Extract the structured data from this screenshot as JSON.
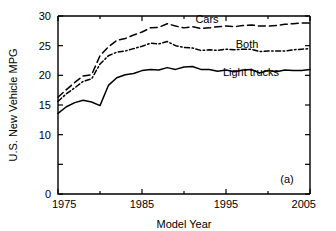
{
  "chart_data": {
    "type": "line",
    "title": "",
    "xlabel": "Model Year",
    "ylabel": "U.S. New Vehicle MPG",
    "panel_label": "(a)",
    "xlim": [
      1975,
      2005
    ],
    "ylim": [
      0,
      30
    ],
    "grid": false,
    "legend_position": "inline-labels",
    "x_ticks_major": [
      1975,
      1985,
      1995,
      2005
    ],
    "x_ticks_minor": [
      1980,
      1990,
      2000
    ],
    "x_tick_labels": [
      "1975",
      "1985",
      "1995",
      "2005"
    ],
    "y_ticks_major": [
      0,
      5,
      10,
      15,
      20,
      25,
      30
    ],
    "y_tick_labels": [
      "0",
      "5",
      "10",
      "15",
      "20",
      "25",
      "30"
    ],
    "y_tick_labels_shown": [
      "0",
      "10",
      "15",
      "20",
      "25",
      "30"
    ],
    "x": [
      1975,
      1976,
      1977,
      1978,
      1979,
      1980,
      1981,
      1982,
      1983,
      1984,
      1985,
      1986,
      1987,
      1988,
      1989,
      1990,
      1991,
      1992,
      1993,
      1994,
      1995,
      1996,
      1997,
      1998,
      1999,
      2000,
      2001,
      2002,
      2003,
      2004,
      2005
    ],
    "series": [
      {
        "name": "Cars",
        "label": "Cars",
        "style": "dashed",
        "color": "#000000",
        "values": [
          16.3,
          17.6,
          18.8,
          19.9,
          20.1,
          23.3,
          24.8,
          25.9,
          26.2,
          26.8,
          27.3,
          28.0,
          28.1,
          28.7,
          28.3,
          28.0,
          28.2,
          27.9,
          28.0,
          28.2,
          28.3,
          28.2,
          28.4,
          28.5,
          28.3,
          28.3,
          28.4,
          28.6,
          28.7,
          28.8,
          28.8
        ]
      },
      {
        "name": "Both",
        "label": "Both",
        "style": "dash-dot",
        "color": "#000000",
        "values": [
          15.6,
          16.9,
          17.9,
          19.0,
          19.4,
          21.9,
          23.3,
          23.9,
          24.1,
          24.5,
          24.9,
          25.4,
          25.3,
          25.7,
          25.0,
          24.7,
          24.6,
          24.2,
          24.3,
          24.2,
          24.4,
          24.3,
          24.4,
          24.4,
          24.0,
          24.1,
          24.1,
          24.1,
          24.3,
          24.4,
          24.5
        ]
      },
      {
        "name": "Light trucks",
        "label": "Light trucks",
        "style": "solid",
        "color": "#000000",
        "values": [
          13.6,
          14.7,
          15.4,
          15.8,
          15.5,
          14.9,
          18.3,
          19.6,
          20.1,
          20.3,
          20.8,
          21.0,
          20.9,
          21.3,
          21.0,
          21.4,
          21.5,
          21.0,
          21.0,
          20.7,
          20.9,
          20.6,
          20.9,
          21.0,
          20.4,
          20.8,
          20.6,
          20.9,
          20.8,
          20.8,
          21.0
        ]
      }
    ]
  }
}
